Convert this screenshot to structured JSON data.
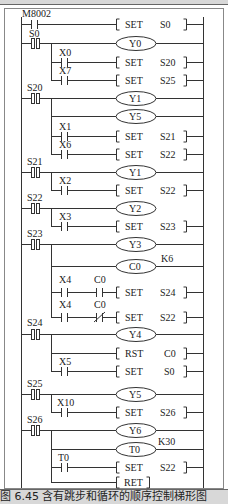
{
  "diagram": {
    "type": "plc-ladder-diagram",
    "rungs": [
      {
        "contacts": [
          {
            "label": "M8002",
            "type": "NO"
          }
        ],
        "output": {
          "kind": "SET",
          "operand": "S0"
        }
      },
      {
        "step": "S0",
        "outputs": [
          {
            "kind": "coil",
            "operand": "Y0"
          }
        ],
        "branches": [
          {
            "contacts": [
              {
                "label": "X0",
                "type": "NO"
              }
            ],
            "output": {
              "kind": "SET",
              "operand": "S20"
            }
          },
          {
            "contacts": [
              {
                "label": "X7",
                "type": "NO"
              }
            ],
            "output": {
              "kind": "SET",
              "operand": "S25"
            }
          }
        ]
      },
      {
        "step": "S20",
        "outputs": [
          {
            "kind": "coil",
            "operand": "Y1"
          },
          {
            "kind": "coil",
            "operand": "Y5"
          }
        ],
        "branches": [
          {
            "contacts": [
              {
                "label": "X1",
                "type": "NO"
              }
            ],
            "output": {
              "kind": "SET",
              "operand": "S21"
            }
          },
          {
            "contacts": [
              {
                "label": "X6",
                "type": "NO"
              }
            ],
            "output": {
              "kind": "SET",
              "operand": "S22"
            }
          }
        ]
      },
      {
        "step": "S21",
        "outputs": [
          {
            "kind": "coil",
            "operand": "Y1"
          }
        ],
        "branches": [
          {
            "contacts": [
              {
                "label": "X2",
                "type": "NO"
              }
            ],
            "output": {
              "kind": "SET",
              "operand": "S22"
            }
          }
        ]
      },
      {
        "step": "S22",
        "outputs": [
          {
            "kind": "coil",
            "operand": "Y2"
          }
        ],
        "branches": [
          {
            "contacts": [
              {
                "label": "X3",
                "type": "NO"
              }
            ],
            "output": {
              "kind": "SET",
              "operand": "S23"
            }
          }
        ]
      },
      {
        "step": "S23",
        "outputs": [
          {
            "kind": "coil",
            "operand": "Y3"
          },
          {
            "kind": "coil",
            "operand": "C0",
            "param": "K6"
          }
        ],
        "branches": [
          {
            "contacts": [
              {
                "label": "X4",
                "type": "NO"
              },
              {
                "label": "C0",
                "type": "NO"
              }
            ],
            "output": {
              "kind": "SET",
              "operand": "S24"
            }
          },
          {
            "contacts": [
              {
                "label": "X4",
                "type": "NO"
              },
              {
                "label": "C0",
                "type": "NC"
              }
            ],
            "output": {
              "kind": "SET",
              "operand": "S22"
            }
          }
        ]
      },
      {
        "step": "S24",
        "outputs": [
          {
            "kind": "coil",
            "operand": "Y4"
          },
          {
            "kind": "RST",
            "operand": "C0"
          }
        ],
        "branches": [
          {
            "contacts": [
              {
                "label": "X5",
                "type": "NO"
              }
            ],
            "output": {
              "kind": "SET",
              "operand": "S0"
            }
          }
        ]
      },
      {
        "step": "S25",
        "outputs": [
          {
            "kind": "coil",
            "operand": "Y5"
          }
        ],
        "branches": [
          {
            "contacts": [
              {
                "label": "X10",
                "type": "NO"
              }
            ],
            "output": {
              "kind": "SET",
              "operand": "S26"
            }
          }
        ]
      },
      {
        "step": "S26",
        "outputs": [
          {
            "kind": "coil",
            "operand": "Y6"
          },
          {
            "kind": "coil",
            "operand": "T0",
            "param": "K30"
          }
        ],
        "branches": [
          {
            "contacts": [
              {
                "label": "T0",
                "type": "NO"
              }
            ],
            "output": {
              "kind": "SET",
              "operand": "S22"
            }
          },
          {
            "contacts": [],
            "output": {
              "kind": "RET",
              "operand": ""
            }
          }
        ]
      }
    ]
  },
  "labels": {
    "set": "SET",
    "rst": "RST",
    "ret": "RET",
    "m8002": "M8002",
    "s0": "S0",
    "s20": "S20",
    "s21": "S21",
    "s22": "S22",
    "s23": "S23",
    "s24": "S24",
    "s25": "S25",
    "s26": "S26",
    "x0": "X0",
    "x1": "X1",
    "x2": "X2",
    "x3": "X3",
    "x4": "X4",
    "x5": "X5",
    "x6": "X6",
    "x7": "X7",
    "x10": "X10",
    "y0": "Y0",
    "y1": "Y1",
    "y2": "Y2",
    "y3": "Y3",
    "y4": "Y4",
    "y5": "Y5",
    "y6": "Y6",
    "c0": "C0",
    "t0": "T0",
    "k6": "K6",
    "k30": "K30"
  },
  "caption": "图 6.45  含有跳步和循环的顺序控制梯形图"
}
